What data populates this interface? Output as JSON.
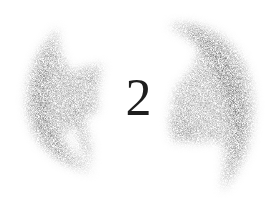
{
  "chapter": {
    "number": "2"
  },
  "decoration": {
    "left_arc": "grainy-left-bracket-smudge",
    "right_arc": "grainy-right-bracket-smudge",
    "smudge_color": "#7a7a7a",
    "numeral_color": "#1e1e1e",
    "background_color": "#ffffff"
  }
}
